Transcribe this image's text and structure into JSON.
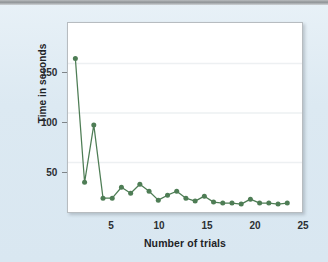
{
  "chart_data": {
    "type": "line",
    "title": "",
    "xlabel": "Number of trials",
    "ylabel": "Time in seconds",
    "x": [
      1,
      2,
      3,
      4,
      5,
      6,
      7,
      8,
      9,
      10,
      11,
      12,
      13,
      14,
      15,
      16,
      17,
      18,
      19,
      20,
      21,
      22,
      23,
      24
    ],
    "values": [
      155,
      30,
      88,
      14,
      14,
      25,
      19,
      28,
      21,
      12,
      17,
      21,
      14,
      11,
      16,
      10,
      9,
      9,
      8,
      13,
      9,
      9,
      8,
      9
    ],
    "series": [
      {
        "name": "Time in seconds",
        "values": [
          155,
          30,
          88,
          14,
          14,
          25,
          19,
          28,
          21,
          12,
          17,
          21,
          14,
          11,
          16,
          10,
          9,
          9,
          8,
          13,
          9,
          9,
          8,
          9
        ],
        "color": "#4e7d55",
        "marker": "circle"
      }
    ],
    "xlim": [
      0.2,
      25.6
    ],
    "ylim": [
      0,
      191
    ],
    "xticks": [
      5,
      10,
      15,
      20,
      25
    ],
    "xtick_labels": [
      "5",
      "10",
      "15",
      "20",
      "25"
    ],
    "yticks": [
      50,
      100,
      150
    ],
    "ytick_labels": [
      "50",
      "100",
      "150"
    ],
    "gridlines": {
      "horizontal": true,
      "vertical": false,
      "color": "#eceff1"
    },
    "legend": null,
    "legend_position": "none",
    "plot_background": "#ffffff",
    "figure_background": "#dce9f2"
  },
  "axes": {
    "y_tick_labels": [
      "150",
      "100",
      "50"
    ],
    "x_tick_labels": [
      "5",
      "10",
      "15",
      "20",
      "25"
    ],
    "y_axis_title": "Time in seconds",
    "x_axis_title": "Number of trials"
  },
  "colors": {
    "series_green": "#4e7d55",
    "figure_bg": "#dce9f2",
    "plot_bg": "#ffffff",
    "grid": "#eceff1",
    "axis_text": "#2c2f33"
  }
}
